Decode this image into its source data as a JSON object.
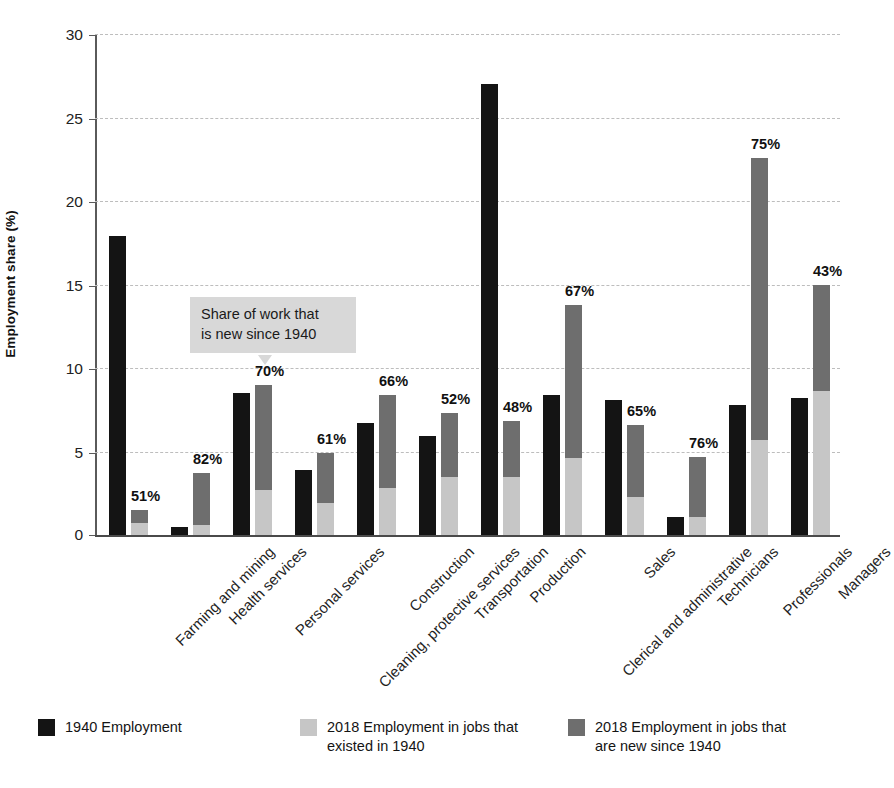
{
  "chart_data": {
    "type": "bar",
    "subtype": "grouped-stacked",
    "title": "",
    "xlabel": "",
    "ylabel": "Employment share (%)",
    "ylim": [
      0,
      30
    ],
    "yticks": [
      0,
      5,
      10,
      15,
      20,
      25,
      30
    ],
    "grid": true,
    "legend_position": "bottom",
    "categories": [
      "Farming and mining",
      "Health services",
      "Personal services",
      "Cleaning, protective services",
      "Construction",
      "Transportation",
      "Production",
      "Clerical and administrative",
      "Sales",
      "Technicians",
      "Professionals",
      "Managers"
    ],
    "series": [
      {
        "name": "1940 Employment",
        "color": "#141414",
        "values": [
          17.9,
          0.5,
          8.5,
          3.9,
          6.7,
          5.9,
          27.0,
          8.4,
          8.1,
          1.1,
          7.8,
          8.2
        ]
      },
      {
        "name": "2018 Employment in jobs that existed in 1940",
        "color": "#c6c6c6",
        "values": [
          0.7,
          0.6,
          2.7,
          1.9,
          2.8,
          3.5,
          3.5,
          4.6,
          2.3,
          1.1,
          5.7,
          8.6
        ]
      },
      {
        "name": "2018 Employment in jobs that are new since 1940",
        "color": "#6e6e6e",
        "values": [
          0.8,
          3.1,
          6.3,
          3.0,
          5.6,
          3.8,
          3.3,
          9.2,
          4.3,
          3.6,
          16.9,
          6.4
        ]
      }
    ],
    "stacked_totals": [
      1.5,
      3.7,
      9.0,
      4.9,
      8.4,
      7.3,
      6.8,
      13.8,
      6.6,
      4.7,
      22.6,
      15.0
    ],
    "data_labels": {
      "description": "Share of 2018 employment in jobs that are new since 1940",
      "values": [
        "51%",
        "82%",
        "70%",
        "61%",
        "66%",
        "52%",
        "48%",
        "67%",
        "65%",
        "76%",
        "75%",
        "43%"
      ]
    }
  },
  "annotation": {
    "line1": "Share of work that",
    "line2": "is new since 1940"
  },
  "legend": {
    "items": [
      {
        "label": "1940 Employment",
        "color": "#141414"
      },
      {
        "label": "2018 Employment in jobs that existed in 1940",
        "color": "#c6c6c6"
      },
      {
        "label": "2018 Employment in jobs that are new since 1940",
        "color": "#6e6e6e"
      }
    ]
  },
  "colors": {
    "bar_1940": "#141414",
    "bar_2018_old": "#c6c6c6",
    "bar_2018_new": "#6e6e6e",
    "gridline": "#bdbdbd",
    "axis": "#5a5a5a",
    "callout_bg": "#d8d8d8",
    "background": "#ffffff"
  }
}
